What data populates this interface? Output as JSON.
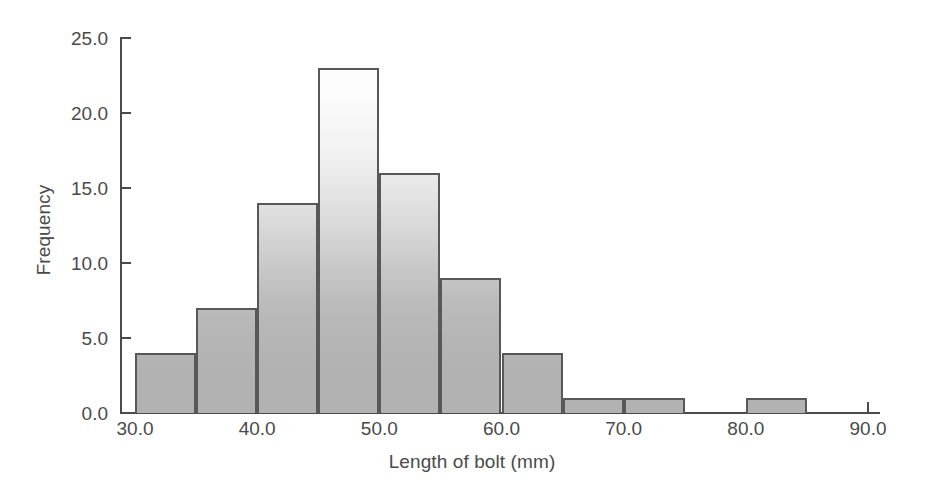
{
  "chart_data": {
    "type": "bar",
    "chart_subtype": "histogram",
    "title": "",
    "xlabel": "Length of bolt (mm)",
    "ylabel": "Frequency",
    "xlim": [
      30.0,
      90.0
    ],
    "ylim": [
      0.0,
      25.0
    ],
    "bin_width": 5,
    "grid": false,
    "legend": null,
    "bin_edges": [
      30,
      35,
      40,
      45,
      50,
      55,
      60,
      65,
      70,
      75,
      80,
      85,
      90
    ],
    "categories": [
      "30-35",
      "35-40",
      "40-45",
      "45-50",
      "50-55",
      "55-60",
      "60-65",
      "65-70",
      "70-75",
      "75-80",
      "80-85",
      "85-90"
    ],
    "values": [
      4,
      7,
      14,
      23,
      16,
      9,
      4,
      1,
      1,
      0,
      1,
      0
    ],
    "bars": [
      {
        "bin_start": 30,
        "bin_end": 35,
        "value": 4
      },
      {
        "bin_start": 35,
        "bin_end": 40,
        "value": 7
      },
      {
        "bin_start": 40,
        "bin_end": 45,
        "value": 14
      },
      {
        "bin_start": 45,
        "bin_end": 50,
        "value": 23
      },
      {
        "bin_start": 50,
        "bin_end": 55,
        "value": 16
      },
      {
        "bin_start": 55,
        "bin_end": 60,
        "value": 9
      },
      {
        "bin_start": 60,
        "bin_end": 65,
        "value": 4
      },
      {
        "bin_start": 65,
        "bin_end": 70,
        "value": 1
      },
      {
        "bin_start": 70,
        "bin_end": 75,
        "value": 1
      },
      {
        "bin_start": 75,
        "bin_end": 80,
        "value": 0
      },
      {
        "bin_start": 80,
        "bin_end": 85,
        "value": 1
      },
      {
        "bin_start": 85,
        "bin_end": 90,
        "value": 0
      }
    ],
    "xticks": [
      30.0,
      40.0,
      50.0,
      60.0,
      70.0,
      80.0,
      90.0
    ],
    "xtick_labels": [
      "30.0",
      "40.0",
      "50.0",
      "60.0",
      "70.0",
      "80.0",
      "90.0"
    ],
    "yticks": [
      0.0,
      5.0,
      10.0,
      15.0,
      20.0,
      25.0
    ],
    "ytick_labels": [
      "0.0",
      "5.0",
      "10.0",
      "15.0",
      "20.0",
      "25.0"
    ],
    "colors": {
      "bar_fill": "#b2b2b2",
      "bar_edge": "#585858",
      "axis": "#4b4b4b",
      "text": "#4a4a4a",
      "background": "#ffffff"
    }
  }
}
